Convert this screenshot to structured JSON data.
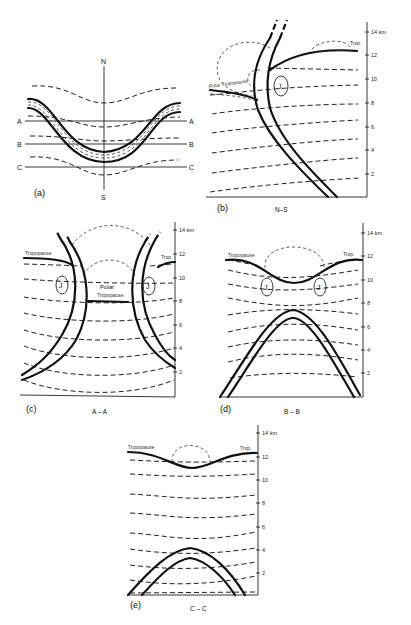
{
  "figure": {
    "panels": [
      {
        "id": "a",
        "label": "(a)",
        "caption": "",
        "compass": {
          "north": "N",
          "south": "S"
        },
        "section_lines": [
          {
            "left": "A",
            "right": "A"
          },
          {
            "left": "B",
            "right": "B"
          },
          {
            "left": "C",
            "right": "C"
          }
        ]
      },
      {
        "id": "b",
        "label": "(b)",
        "caption": "N–S",
        "axis_unit": "14 km",
        "ticks": [
          "12",
          "10",
          "8",
          "6",
          "4",
          "2"
        ],
        "annotations": {
          "tropopause_left": "Polar Tropopause",
          "tropopause_right": "Trop.",
          "jet": "J"
        }
      },
      {
        "id": "c",
        "label": "(c)",
        "caption": "A – A",
        "axis_unit": "14 km",
        "ticks": [
          "12",
          "10",
          "8",
          "6",
          "4",
          "2"
        ],
        "annotations": {
          "tropopause_left": "Tropopause",
          "tropopause_right": "Trop.",
          "polar_1": "Polar",
          "polar_2": "Tropopause",
          "jet": "J"
        }
      },
      {
        "id": "d",
        "label": "(d)",
        "caption": "B – B",
        "axis_unit": "14 km",
        "ticks": [
          "12",
          "10",
          "8",
          "6",
          "4",
          "2"
        ],
        "annotations": {
          "tropopause_left": "Tropopause",
          "tropopause_right": "Trop.",
          "jet": "J"
        }
      },
      {
        "id": "e",
        "label": "(e)",
        "caption": "C – C",
        "axis_unit": "14 km",
        "ticks": [
          "12",
          "10",
          "8",
          "6",
          "4",
          "2"
        ],
        "annotations": {
          "tropopause_left": "Tropopause",
          "tropopause_right": "Trop."
        }
      }
    ]
  }
}
